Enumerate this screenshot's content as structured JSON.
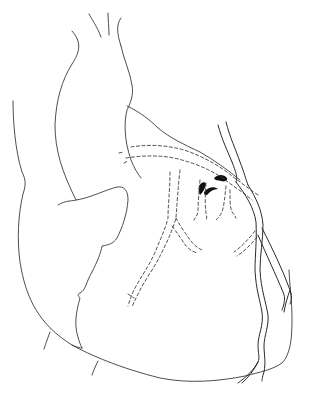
{
  "figure": {
    "background_color": "#ffffff",
    "line_color": "#3a3a3a",
    "structures": [
      "aorta",
      "pulmonary-trunk",
      "superior-vena-cava",
      "right-atrium",
      "right-ventricle",
      "left-ventricle",
      "left-anterior-descending-artery",
      "diagonal-branches",
      "coronary-ostia-marks"
    ]
  }
}
